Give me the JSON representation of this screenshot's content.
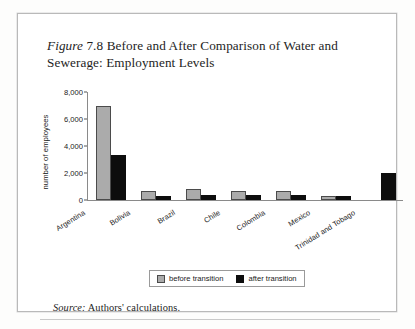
{
  "figure": {
    "label": "Figure",
    "number": "7.8",
    "title": "Before and After Comparison of Water and Sewerage: Employment Levels"
  },
  "source": {
    "label": "Source:",
    "text": "Authors' calculations."
  },
  "chart_data": {
    "type": "bar",
    "title": "Figure 7.8 Before and After Comparison of Water and Sewerage: Employment Levels",
    "xlabel": "",
    "ylabel": "number of employees",
    "ylim": [
      0,
      8000
    ],
    "yticks": [
      "0",
      "2,000",
      "4,000",
      "6,000",
      "8,000"
    ],
    "ytick_values": [
      0,
      2000,
      4000,
      6000,
      8000
    ],
    "grid": false,
    "legend_position": "bottom",
    "categories": [
      "Argentina",
      "Bolivia",
      "Brazil",
      "Chile",
      "Colombia",
      "Mexico",
      "Trinidad and Tobago"
    ],
    "series": [
      {
        "name": "before transition",
        "color": "#ababab",
        "values": [
          7000,
          650,
          800,
          700,
          700,
          320,
          0
        ]
      },
      {
        "name": "after transition",
        "color": "#0d0d0d",
        "values": [
          3300,
          300,
          400,
          350,
          350,
          280,
          2000
        ]
      }
    ]
  }
}
